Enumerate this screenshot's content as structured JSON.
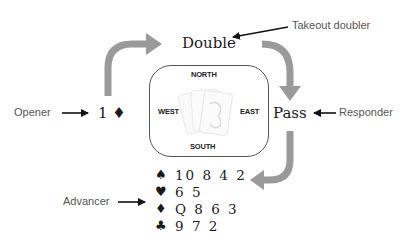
{
  "diagram": {
    "bids": {
      "opener_bid": "1 ♦",
      "double": "Double",
      "pass": "Pass"
    },
    "callouts": {
      "opener": "Opener",
      "takeout_doubler": "Takeout doubler",
      "responder": "Responder",
      "advancer": "Advancer"
    },
    "table": {
      "north": "NORTH",
      "south": "SOUTH",
      "east": "EAST",
      "west": "WEST"
    },
    "advancer_hand": [
      {
        "suit": "♠",
        "suit_name": "spades",
        "cards": "10 8 4 2"
      },
      {
        "suit": "♥",
        "suit_name": "hearts",
        "cards": "6 5"
      },
      {
        "suit": "♦",
        "suit_name": "diamonds",
        "cards": "Q 8 6 3"
      },
      {
        "suit": "♣",
        "suit_name": "clubs",
        "cards": "9 7 2"
      }
    ],
    "colors": {
      "flow_arrow": "#9a9a9a",
      "pointer_arrow": "#111111",
      "label_text": "#555555",
      "box_border": "#555555"
    }
  }
}
